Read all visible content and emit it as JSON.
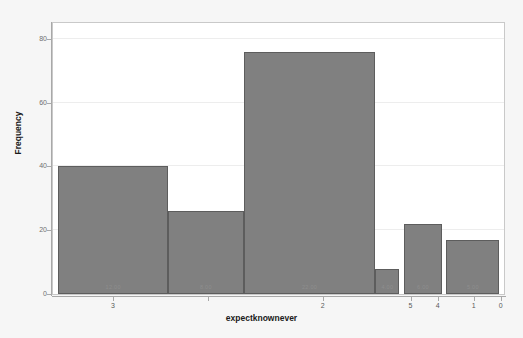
{
  "chart_data": {
    "type": "bar",
    "title": "",
    "subtitle": "",
    "xlabel": "expectknownever",
    "ylabel": "Frequency",
    "ylim": [
      0,
      85
    ],
    "yticks": [
      0,
      20,
      40,
      60,
      80
    ],
    "ytick_labels": [
      "0",
      "20",
      "40",
      "60",
      "80"
    ],
    "xtick_labels": [
      "3",
      "",
      "2",
      "5",
      "4",
      "1",
      "0"
    ],
    "xtick_positions": [
      0.135,
      0.345,
      0.6,
      0.795,
      0.855,
      0.935,
      0.995
    ],
    "grid": true,
    "legend": null,
    "bar_color": "#808080",
    "bar_edge_color": "#5d5d5d",
    "plot_background": "#ffffff",
    "figure_background": "#f6f6f6",
    "categories": [
      "3",
      "4",
      "2",
      "5",
      "4b",
      "1"
    ],
    "values": [
      40,
      26,
      76,
      8,
      22,
      17
    ],
    "bars": [
      {
        "label": "12.00",
        "value": 40,
        "x_start": 0.012,
        "x_end": 0.255
      },
      {
        "label": "8.00",
        "value": 26,
        "x_start": 0.255,
        "x_end": 0.423
      },
      {
        "label": "22.00",
        "value": 76,
        "x_start": 0.423,
        "x_end": 0.715
      },
      {
        "label": "4.00",
        "value": 8,
        "x_start": 0.715,
        "x_end": 0.768
      },
      {
        "label": "6.00",
        "value": 22,
        "x_start": 0.778,
        "x_end": 0.863
      },
      {
        "label": "5.00",
        "value": 17,
        "x_start": 0.872,
        "x_end": 0.99
      }
    ]
  },
  "axis": {
    "y_title": "Frequency",
    "x_title": "expectknownever"
  }
}
